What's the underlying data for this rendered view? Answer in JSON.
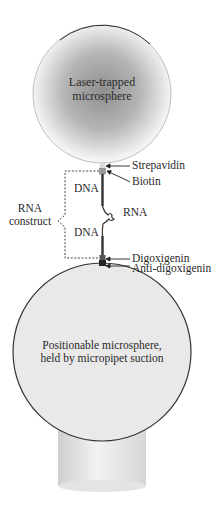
{
  "diagram": {
    "top_sphere": {
      "label_line1": "Laser-trapped",
      "label_line2": "microsphere"
    },
    "bottom_sphere": {
      "label_line1": "Positionable microsphere,",
      "label_line2": "held by micropipet suction"
    },
    "annotations": {
      "strepavidin": "Strepavidin",
      "biotin": "Biotin",
      "rna": "RNA",
      "digoxigenin": "Digoxigenin",
      "anti_digoxigenin": "Anti-digoxigenin"
    },
    "construct": {
      "label_line1": "RNA",
      "label_line2": "construct",
      "dna_upper": "DNA",
      "dna_lower": "DNA"
    },
    "colors": {
      "top_sphere_center": "#8c8c8c",
      "top_sphere_edge": "#f2f2f2",
      "bottom_sphere_fill": "#e8e8e8",
      "outline": "#333333"
    }
  }
}
